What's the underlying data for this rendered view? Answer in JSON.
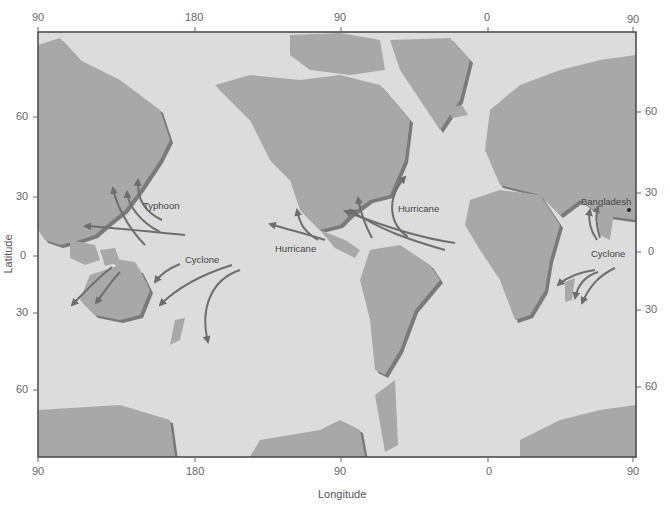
{
  "map": {
    "type": "world-map",
    "projection": "Mercator-like, centered on Pacific",
    "colors": {
      "ocean": "#dcdcdc",
      "land": "#a8a8a8",
      "land_shadow": "#7a7a7a",
      "arrows": "#6e6e6e",
      "frame": "#444444",
      "text": "#444444"
    },
    "x_axis": {
      "title": "Longitude",
      "top_ticks": [
        "90",
        "180",
        "90",
        "0",
        "90"
      ],
      "bottom_ticks": [
        "90",
        "180",
        "90",
        "0",
        "90"
      ]
    },
    "y_axis": {
      "title": "Latitude",
      "left_ticks": [
        "60",
        "30",
        "0",
        "30",
        "60"
      ],
      "right_ticks": [
        "60",
        "30",
        "0",
        "30",
        "60"
      ]
    },
    "labels": {
      "typhoon": "Typhoon",
      "cyclone_pacific": "Cyclone",
      "hurricane_pacific": "Hurricane",
      "hurricane_atlantic": "Hurricane",
      "bangladesh": "Bangladesh",
      "cyclone_indian": "Cyclone"
    }
  }
}
